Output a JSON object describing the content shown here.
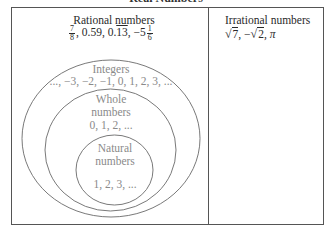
{
  "diagram": {
    "title": "Real Numbers",
    "rational": {
      "label": "Rational numbers",
      "examples": {
        "frac1_num": "7",
        "frac1_den": "8",
        "decimal1": "0.59",
        "repeating_int": "0.",
        "repeating_digits": "13",
        "mixed_sign_int": "−5",
        "frac2_num": "1",
        "frac2_den": "6",
        "sep": ", "
      }
    },
    "irrational": {
      "label": "Irrational numbers",
      "examples": {
        "sqrt1": "7",
        "neg": "−",
        "sqrt2": "2",
        "pi": "π",
        "sep": ", "
      }
    },
    "integers": {
      "label": "Integers",
      "examples": "..., −3, −2, −1, 0, 1, 2, 3, ..."
    },
    "whole": {
      "label_line1": "Whole",
      "label_line2": "numbers",
      "examples": "0, 1, 2, ..."
    },
    "natural": {
      "label_line1": "Natural",
      "label_line2": "numbers",
      "examples": "1, 2, 3, ..."
    },
    "colors": {
      "border": "#555555",
      "ellipse": "#6a6a6a",
      "dark_text": "#2a2a2a",
      "grey_text": "#8a8a8a"
    }
  }
}
